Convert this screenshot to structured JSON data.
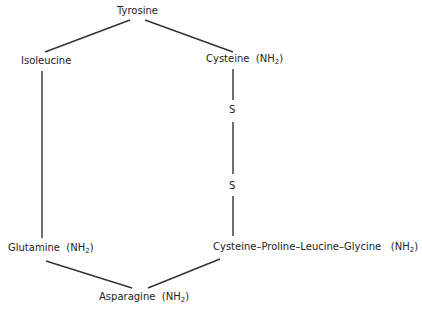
{
  "diagram": {
    "nodes": {
      "tyrosine": "Tyrosine",
      "isoleucine": "Isoleucine",
      "cysteine_top": "Cysteine",
      "cysteine_top_group": "(NH",
      "sulfur_1": "S",
      "sulfur_2": "S",
      "glutamine": "Glutamine",
      "glutamine_group": "(NH",
      "cysteine_chain": "Cysteine–Proline–Leucine–Glycine",
      "cysteine_chain_group": "(NH",
      "asparagine": "Asparagine",
      "asparagine_group": "(NH",
      "subscript": "2",
      "close_paren": ")"
    },
    "edges": [
      [
        "Tyrosine",
        "Isoleucine"
      ],
      [
        "Tyrosine",
        "Cysteine (NH2)"
      ],
      [
        "Isoleucine",
        "Glutamine (NH2)"
      ],
      [
        "Cysteine (NH2)",
        "S"
      ],
      [
        "S",
        "S"
      ],
      [
        "S",
        "Cysteine-Proline-Leucine-Glycine (NH2)"
      ],
      [
        "Glutamine (NH2)",
        "Asparagine (NH2)"
      ],
      [
        "Cysteine-Proline-Leucine-Glycine (NH2)",
        "Asparagine (NH2)"
      ]
    ],
    "line_color": "#333333"
  }
}
